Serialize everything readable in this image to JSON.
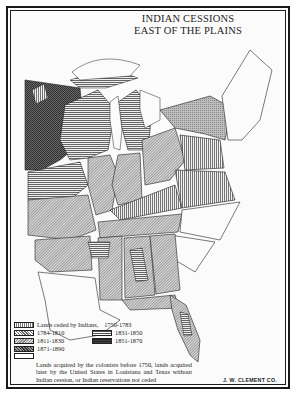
{
  "map": {
    "title_line1": "INDIAN CESSIONS",
    "title_line2": "EAST OF THE PLAINS",
    "credit": "J. W. CLEMENT CO."
  },
  "legend": {
    "heading": "Lands ceded by Indians,",
    "items": [
      {
        "label": "1750-1783",
        "pattern": "vertical-lines"
      },
      {
        "label": "1784-1810",
        "pattern": "fine-crosshatch"
      },
      {
        "label": "1811-1830",
        "pattern": "diagonal-stipple"
      },
      {
        "label": "1871-1890",
        "pattern": "dark-crosshatch"
      },
      {
        "label": "1831-1850",
        "pattern": "horizontal-lines"
      },
      {
        "label": "1851-1870",
        "pattern": "dense-horizontal"
      }
    ],
    "note": "Lands acquired by the colonists before 1750, lands acquired later by the United States in Louisiana and Texas without Indian cession, or Indian reservations not ceded"
  },
  "colors": {
    "ink": "#1a1a1a",
    "paper": "#fbfbfb",
    "dark_fill": "#4a4a4a",
    "mid_fill": "#9a9a9a",
    "light_fill": "#c8c8c8"
  }
}
